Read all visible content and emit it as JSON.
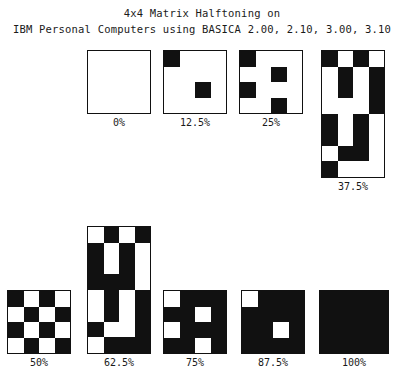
{
  "title": {
    "line1": "4x4 Matrix Halftoning on",
    "line2": "IBM Personal Computers using BASICA 2.00, 2.10, 3.00, 3.10"
  },
  "colors": {
    "ink": "#111111",
    "paper": "#ffffff",
    "text": "#1a1a1a"
  },
  "chart_data": {
    "type": "heatmap",
    "title": "4x4 Matrix Halftoning on IBM Personal Computers using BASICA 2.00, 2.10, 3.00, 3.10",
    "subtitle": "",
    "xlabel": "",
    "ylabel": "",
    "legend": [
      "0 = white cell",
      "1 = black cell"
    ],
    "categories": [
      "0%",
      "12.5%",
      "25%",
      "37.5%",
      "50%",
      "62.5%",
      "75%",
      "87.5%",
      "100%"
    ],
    "values": [
      0,
      12.5,
      25,
      37.5,
      50,
      62.5,
      75,
      87.5,
      100
    ],
    "patterns": [
      {
        "label": "0%",
        "coverage": 0,
        "cols": 4,
        "rows": 4,
        "matrix": [
          [
            0,
            0,
            0,
            0
          ],
          [
            0,
            0,
            0,
            0
          ],
          [
            0,
            0,
            0,
            0
          ],
          [
            0,
            0,
            0,
            0
          ]
        ]
      },
      {
        "label": "12.5%",
        "coverage": 12.5,
        "cols": 4,
        "rows": 4,
        "matrix": [
          [
            1,
            0,
            0,
            0
          ],
          [
            0,
            0,
            0,
            0
          ],
          [
            0,
            0,
            1,
            0
          ],
          [
            0,
            0,
            0,
            0
          ]
        ]
      },
      {
        "label": "25%",
        "coverage": 25,
        "cols": 4,
        "rows": 4,
        "matrix": [
          [
            1,
            0,
            0,
            0
          ],
          [
            0,
            0,
            1,
            0
          ],
          [
            1,
            0,
            0,
            0
          ],
          [
            0,
            0,
            1,
            0
          ]
        ]
      },
      {
        "label": "37.5%",
        "coverage": 37.5,
        "cols": 4,
        "rows": 8,
        "matrix": [
          [
            1,
            0,
            1,
            0
          ],
          [
            0,
            1,
            0,
            1
          ],
          [
            0,
            1,
            0,
            1
          ],
          [
            0,
            0,
            0,
            1
          ],
          [
            1,
            0,
            1,
            0
          ],
          [
            1,
            0,
            1,
            0
          ],
          [
            0,
            1,
            1,
            0
          ],
          [
            1,
            0,
            0,
            0
          ]
        ]
      },
      {
        "label": "50%",
        "coverage": 50,
        "cols": 4,
        "rows": 4,
        "matrix": [
          [
            1,
            0,
            1,
            0
          ],
          [
            0,
            1,
            0,
            1
          ],
          [
            1,
            0,
            1,
            0
          ],
          [
            0,
            1,
            0,
            1
          ]
        ]
      },
      {
        "label": "62.5%",
        "coverage": 62.5,
        "cols": 4,
        "rows": 8,
        "matrix": [
          [
            0,
            1,
            0,
            1
          ],
          [
            1,
            0,
            1,
            0
          ],
          [
            1,
            0,
            1,
            0
          ],
          [
            1,
            1,
            1,
            0
          ],
          [
            0,
            1,
            0,
            1
          ],
          [
            0,
            1,
            0,
            1
          ],
          [
            1,
            0,
            0,
            1
          ],
          [
            0,
            1,
            1,
            1
          ]
        ]
      },
      {
        "label": "75%",
        "coverage": 75,
        "cols": 4,
        "rows": 4,
        "matrix": [
          [
            0,
            1,
            1,
            1
          ],
          [
            1,
            1,
            0,
            1
          ],
          [
            0,
            1,
            1,
            1
          ],
          [
            1,
            1,
            0,
            1
          ]
        ]
      },
      {
        "label": "87.5%",
        "coverage": 87.5,
        "cols": 4,
        "rows": 4,
        "matrix": [
          [
            0,
            1,
            1,
            1
          ],
          [
            1,
            1,
            1,
            1
          ],
          [
            1,
            1,
            0,
            1
          ],
          [
            1,
            1,
            1,
            1
          ]
        ]
      },
      {
        "label": "100%",
        "coverage": 100,
        "cols": 4,
        "rows": 4,
        "matrix": [
          [
            1,
            1,
            1,
            1
          ],
          [
            1,
            1,
            1,
            1
          ],
          [
            1,
            1,
            1,
            1
          ],
          [
            1,
            1,
            1,
            1
          ]
        ]
      }
    ]
  },
  "layout": {
    "swatches": [
      {
        "index": 0,
        "left": 87,
        "top": 50,
        "width": 64,
        "height": 64,
        "labelTop": 116
      },
      {
        "index": 1,
        "left": 163,
        "top": 50,
        "width": 64,
        "height": 64,
        "labelTop": 116
      },
      {
        "index": 2,
        "left": 239,
        "top": 50,
        "width": 64,
        "height": 64,
        "labelTop": 116
      },
      {
        "index": 3,
        "left": 321,
        "top": 50,
        "width": 64,
        "height": 128,
        "labelTop": 180
      },
      {
        "index": 4,
        "left": 7,
        "top": 290,
        "width": 64,
        "height": 64,
        "labelTop": 356
      },
      {
        "index": 5,
        "left": 87,
        "top": 226,
        "width": 64,
        "height": 128,
        "labelTop": 356
      },
      {
        "index": 6,
        "left": 163,
        "top": 290,
        "width": 64,
        "height": 64,
        "labelTop": 356
      },
      {
        "index": 7,
        "left": 241,
        "top": 290,
        "width": 64,
        "height": 64,
        "labelTop": 356
      },
      {
        "index": 8,
        "left": 319,
        "top": 290,
        "width": 70,
        "height": 64,
        "labelTop": 356
      }
    ]
  }
}
